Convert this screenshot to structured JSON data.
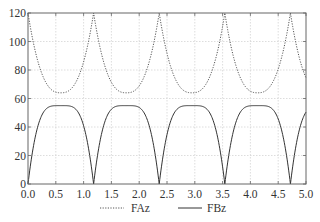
{
  "chart_data": {
    "type": "line",
    "title": "",
    "xlabel": "",
    "ylabel": "",
    "xlim": [
      0,
      5
    ],
    "ylim": [
      0,
      120
    ],
    "grid": true,
    "legend_position": "bottom",
    "x_ticks": [
      "0.0",
      "0.5",
      "1.0",
      "1.5",
      "2.0",
      "2.5",
      "3.0",
      "3.5",
      "4.0",
      "4.5",
      "5.0"
    ],
    "y_ticks": [
      "0",
      "20",
      "40",
      "60",
      "80",
      "100",
      "120"
    ],
    "period": 1.18,
    "series": [
      {
        "name": "FAz",
        "style": "dotted",
        "color": "#555555",
        "description": "Periodic; peaks of 120 at x≈0, 1.18, 2.36, 3.54, 4.72; minima ≈64 at x≈0.59, 1.77, 2.95, 4.13",
        "x": [
          0.0,
          0.1,
          0.2,
          0.3,
          0.4,
          0.5,
          0.59,
          0.7,
          0.8,
          0.9,
          1.0,
          1.1,
          1.18,
          1.28,
          1.38,
          1.48,
          1.58,
          1.68,
          1.77,
          1.88,
          1.98,
          2.08,
          2.18,
          2.28,
          2.36,
          2.46,
          2.56,
          2.66,
          2.76,
          2.86,
          2.95,
          3.06,
          3.16,
          3.26,
          3.36,
          3.46,
          3.54,
          3.64,
          3.74,
          3.84,
          3.94,
          4.04,
          4.13,
          4.24,
          4.34,
          4.44,
          4.54,
          4.64,
          4.72,
          4.82,
          4.92,
          5.0
        ],
        "values": [
          120,
          101,
          84,
          73,
          67,
          65,
          64,
          65,
          69,
          77,
          90,
          108,
          120,
          101,
          84,
          73,
          67,
          65,
          64,
          65,
          69,
          77,
          90,
          108,
          120,
          101,
          84,
          73,
          67,
          65,
          64,
          65,
          69,
          77,
          90,
          108,
          120,
          101,
          84,
          73,
          67,
          65,
          64,
          65,
          69,
          77,
          90,
          108,
          120,
          101,
          84,
          74
        ]
      },
      {
        "name": "FBz",
        "style": "solid",
        "color": "#333333",
        "description": "Periodic; zeros at x≈0, 1.18, 2.36, 3.54, 4.72; flat-topped maxima ≈55 near x≈0.59, 1.77, 2.95, 4.13",
        "x": [
          0.0,
          0.1,
          0.2,
          0.3,
          0.4,
          0.5,
          0.59,
          0.7,
          0.8,
          0.9,
          1.0,
          1.1,
          1.18,
          1.28,
          1.38,
          1.48,
          1.58,
          1.68,
          1.77,
          1.88,
          1.98,
          2.08,
          2.18,
          2.28,
          2.36,
          2.46,
          2.56,
          2.66,
          2.76,
          2.86,
          2.95,
          3.06,
          3.16,
          3.26,
          3.36,
          3.46,
          3.54,
          3.64,
          3.74,
          3.84,
          3.94,
          4.04,
          4.13,
          4.24,
          4.34,
          4.44,
          4.54,
          4.64,
          4.72,
          4.82,
          4.92,
          5.0
        ],
        "values": [
          0,
          24,
          42,
          51,
          54,
          55,
          55,
          55,
          53,
          47,
          34,
          12,
          0,
          24,
          42,
          51,
          54,
          55,
          55,
          55,
          53,
          47,
          34,
          12,
          0,
          24,
          42,
          51,
          54,
          55,
          55,
          55,
          53,
          47,
          34,
          12,
          0,
          24,
          42,
          51,
          54,
          55,
          55,
          55,
          53,
          47,
          34,
          12,
          0,
          24,
          42,
          48
        ]
      }
    ]
  },
  "legend": {
    "items": [
      {
        "label": "FAz",
        "style": "dotted"
      },
      {
        "label": "FBz",
        "style": "solid"
      }
    ]
  }
}
